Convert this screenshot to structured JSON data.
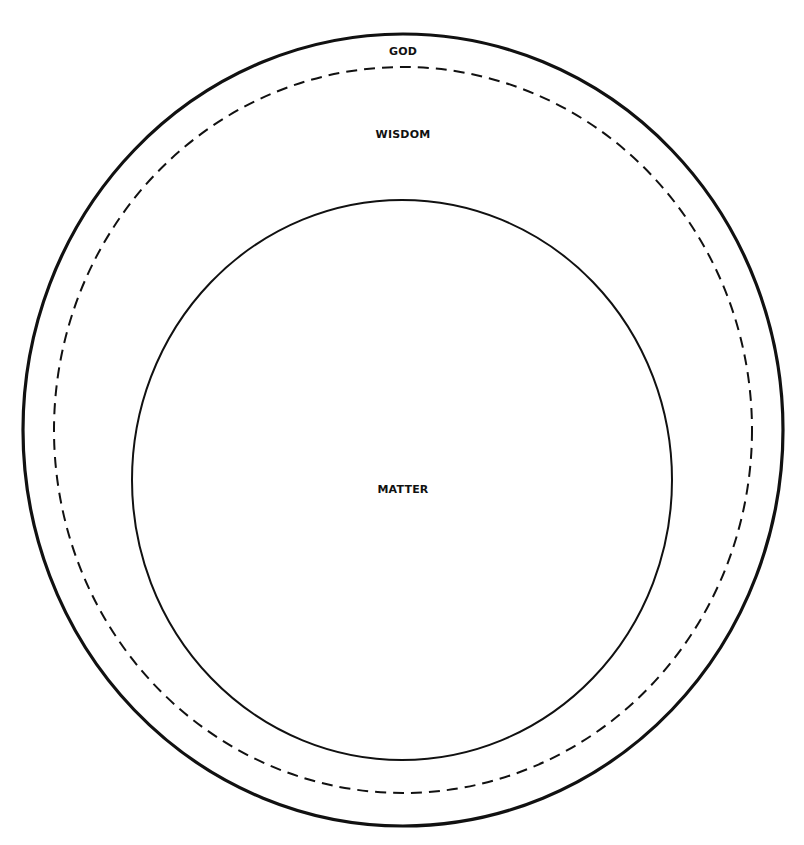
{
  "diagram": {
    "type": "nested-ellipses",
    "background": "#ffffff",
    "stroke_color": "#111111",
    "regions": [
      {
        "id": "god",
        "label": "GOD",
        "shape": "ellipse",
        "border": "solid-thick",
        "cx": 403,
        "cy": 430,
        "rx": 380,
        "ry": 396,
        "stroke_width": 3.2
      },
      {
        "id": "wisdom",
        "label": "WISDOM",
        "shape": "ellipse",
        "border": "dashed",
        "cx": 403,
        "cy": 430,
        "rx": 349,
        "ry": 363,
        "stroke_width": 2,
        "dash": "11 7"
      },
      {
        "id": "matter",
        "label": "MATTER",
        "shape": "ellipse",
        "border": "solid-thin",
        "cx": 402,
        "cy": 480,
        "rx": 270,
        "ry": 280,
        "stroke_width": 2
      }
    ]
  }
}
